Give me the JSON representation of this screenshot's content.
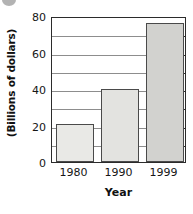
{
  "chart_data": {
    "type": "bar",
    "title": "",
    "subtitle": "",
    "xlabel": "Year",
    "ylabel": "(Billions of dollars)",
    "categories": [
      "1980",
      "1990",
      "1999"
    ],
    "values": [
      21,
      40,
      76
    ],
    "series": [
      {
        "name": "Amount",
        "values": [
          21,
          40,
          76
        ]
      }
    ],
    "ylim": [
      0,
      80
    ],
    "y_ticks": [
      0,
      20,
      40,
      60,
      80
    ],
    "y_tick_labels": [
      "0",
      "20",
      "40",
      "60",
      "80"
    ],
    "y_minor_step": 10,
    "gridlines": "horizontal",
    "legend": "none",
    "bar_colors": [
      "#e9e9e6",
      "#e3e3e0",
      "#d2d2cf"
    ],
    "bar_edge_color": "#4a4a4a",
    "grid_color": "#8d8d8d",
    "frame_color": "#2b2b2b",
    "background": "#ffffff",
    "annotations": []
  },
  "figure": {
    "artifact_name": "page-bullet-artifact"
  }
}
